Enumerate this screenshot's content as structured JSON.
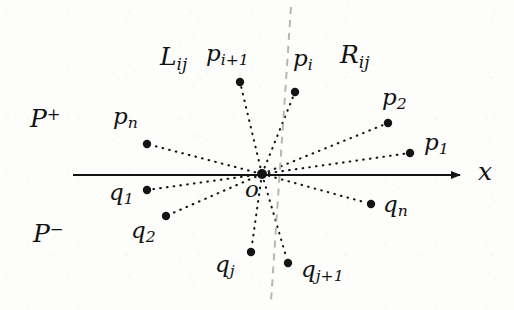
{
  "figure": {
    "width": 514,
    "height": 310,
    "background_color": "#fdfdfc",
    "ink_color": "#141414",
    "dashed_guide_color": "#b6b6b6"
  },
  "axis": {
    "name": "x-axis",
    "label": "x",
    "label_x": 478,
    "label_y": 159,
    "y": 175,
    "x_start": 73,
    "x_end": 462,
    "stroke_width": 2.0,
    "arrow": true
  },
  "origin": {
    "label": "o",
    "x": 262,
    "y": 174,
    "radius": 5.0,
    "label_x": 245,
    "label_y": 178
  },
  "guide_line": {
    "name": "bisector-dashed-line",
    "x1": 291,
    "y1": 7,
    "x2": 271,
    "y2": 301,
    "dash": "7 6",
    "color": "#b6b6b6",
    "stroke_width": 2.0
  },
  "region_labels": [
    {
      "id": "L-ij",
      "base": "L",
      "sub": "ij",
      "sup": "",
      "x": 160,
      "y": 44,
      "size": "sz-big"
    },
    {
      "id": "R-ij",
      "base": "R",
      "sub": "ij",
      "sup": "",
      "x": 340,
      "y": 42,
      "size": "sz-big"
    },
    {
      "id": "P-plus",
      "base": "P",
      "sub": "",
      "sup": "+",
      "x": 30,
      "y": 106,
      "size": "sz-big"
    },
    {
      "id": "P-minus",
      "base": "P",
      "sub": "",
      "sup": "−",
      "x": 33,
      "y": 221,
      "size": "sz-big"
    }
  ],
  "points": [
    {
      "id": "p-i-plus-1",
      "base": "p",
      "sub": "i+1",
      "dot_x": 240,
      "dot_y": 82,
      "label_x": 206,
      "label_y": 42,
      "r": 4.2
    },
    {
      "id": "p-i",
      "base": "p",
      "sub": "i",
      "dot_x": 295,
      "dot_y": 92,
      "label_x": 293,
      "label_y": 47,
      "r": 4.2
    },
    {
      "id": "p-2",
      "base": "p",
      "sub": "2",
      "dot_x": 388,
      "dot_y": 123,
      "label_x": 382,
      "label_y": 86,
      "r": 4.2
    },
    {
      "id": "p-1",
      "base": "p",
      "sub": "1",
      "dot_x": 410,
      "dot_y": 153,
      "label_x": 424,
      "label_y": 131,
      "r": 4.2
    },
    {
      "id": "p-n",
      "base": "p",
      "sub": "n",
      "dot_x": 147,
      "dot_y": 144,
      "label_x": 113,
      "label_y": 105,
      "r": 4.2
    },
    {
      "id": "q-1",
      "base": "q",
      "sub": "1",
      "dot_x": 147,
      "dot_y": 190,
      "label_x": 109,
      "label_y": 181,
      "r": 4.2
    },
    {
      "id": "q-2",
      "base": "q",
      "sub": "2",
      "dot_x": 166,
      "dot_y": 216,
      "label_x": 131,
      "label_y": 219,
      "r": 4.2
    },
    {
      "id": "q-j",
      "base": "q",
      "sub": "j",
      "dot_x": 251,
      "dot_y": 252,
      "label_x": 215,
      "label_y": 253,
      "r": 4.2
    },
    {
      "id": "q-j-plus-1",
      "base": "q",
      "sub": "j+1",
      "dot_x": 288,
      "dot_y": 263,
      "label_x": 301,
      "label_y": 258,
      "r": 4.2
    },
    {
      "id": "q-n",
      "base": "q",
      "sub": "n",
      "dot_x": 371,
      "dot_y": 204,
      "label_x": 383,
      "label_y": 193,
      "r": 4.2
    }
  ],
  "rays": [
    {
      "id": "ray-to-p-i-plus-1",
      "to": "p-i-plus-1"
    },
    {
      "id": "ray-to-p-i",
      "to": "p-i"
    },
    {
      "id": "ray-to-p-2",
      "to": "p-2"
    },
    {
      "id": "ray-to-p-1",
      "to": "p-1"
    },
    {
      "id": "ray-to-p-n",
      "to": "p-n"
    },
    {
      "id": "ray-to-q-1",
      "to": "q-1"
    },
    {
      "id": "ray-to-q-2",
      "to": "q-2"
    },
    {
      "id": "ray-to-q-j",
      "to": "q-j"
    },
    {
      "id": "ray-to-q-j-plus-1",
      "to": "q-j-plus-1"
    },
    {
      "id": "ray-to-q-n",
      "to": "q-n"
    }
  ]
}
